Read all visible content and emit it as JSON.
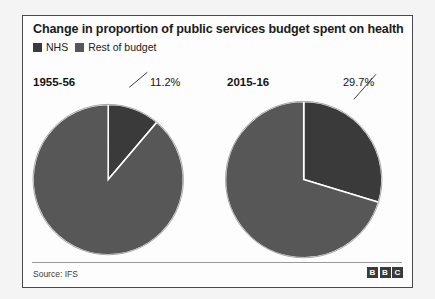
{
  "panel": {
    "title": "Change in proportion of public services budget spent on health",
    "source": "Source: IFS",
    "logo": [
      "B",
      "B",
      "C"
    ]
  },
  "legend": {
    "items": [
      {
        "label": "NHS",
        "color": "#3a3a3a"
      },
      {
        "label": "Rest of budget",
        "color": "#575757"
      }
    ]
  },
  "colors": {
    "nhs": "#3a3a3a",
    "rest": "#575757",
    "separator": "#ffffff",
    "panel_border": "#4a4a4a",
    "page_background": "#f4f4f4",
    "panel_background": "#fdfdfd",
    "text": "#1b1b1b"
  },
  "chart_data": {
    "type": "pie",
    "title": "Change in proportion of public services budget spent on health",
    "xlabel": "",
    "ylabel": "",
    "legend_position": "top-left",
    "grid": false,
    "source": "Source: IFS",
    "charts": [
      {
        "name": "1955-56",
        "year_label": "1955-56",
        "pct_label": "11.2%",
        "slices": [
          {
            "name": "NHS",
            "value": 11.2,
            "color": "#3a3a3a"
          },
          {
            "name": "Rest of budget",
            "value": 88.8,
            "color": "#575757"
          }
        ]
      },
      {
        "name": "2015-16",
        "year_label": "2015-16",
        "pct_label": "29.7%",
        "slices": [
          {
            "name": "NHS",
            "value": 29.7,
            "color": "#3a3a3a"
          },
          {
            "name": "Rest of budget",
            "value": 70.3,
            "color": "#575757"
          }
        ]
      }
    ]
  }
}
